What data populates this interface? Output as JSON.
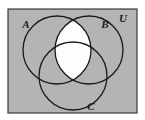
{
  "figure": {
    "kind": "venn-diagram",
    "sets_count": 3,
    "universe_label": "U",
    "shaded_region_description": "A intersect B",
    "colors": {
      "universe_fill": "#b4b4b4",
      "universe_border": "#3a3a3a",
      "circle_stroke": "#1a1a1a",
      "shaded_fill": "#fdfdfb",
      "page_background": "#ffffff",
      "label_color": "#1a1a1a"
    },
    "rectangle": {
      "x": 8,
      "y": 9,
      "width": 129,
      "height": 104
    },
    "circles": [
      {
        "id": "A",
        "label": "A",
        "cx": 57,
        "cy": 50,
        "r": 34
      },
      {
        "id": "B",
        "label": "B",
        "cx": 89,
        "cy": 50,
        "r": 34
      },
      {
        "id": "C",
        "label": "C",
        "cx": 73,
        "cy": 76,
        "r": 34
      }
    ],
    "labels": [
      {
        "id": "label-a",
        "text": "A",
        "x": 26,
        "y": 28
      },
      {
        "id": "label-b",
        "text": "B",
        "x": 105,
        "y": 28
      },
      {
        "id": "label-c",
        "text": "C",
        "x": 91,
        "y": 110
      },
      {
        "id": "label-u",
        "text": "U",
        "x": 123,
        "y": 22
      }
    ]
  }
}
